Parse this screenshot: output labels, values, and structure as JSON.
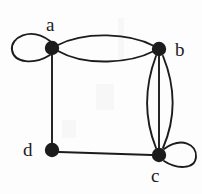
{
  "figure": {
    "type": "undirected-multigraph-diagram",
    "background_color": "#fdfdfd",
    "stroke_color": "#1c1c1c",
    "width": 202,
    "height": 194
  },
  "graph": {
    "vertices": [
      {
        "id": "a",
        "label": "a",
        "cx": 52,
        "cy": 48,
        "r": 7,
        "label_position": "above"
      },
      {
        "id": "b",
        "label": "b",
        "cx": 159,
        "cy": 49,
        "r": 7,
        "label_position": "right"
      },
      {
        "id": "c",
        "label": "c",
        "cx": 159,
        "cy": 155,
        "r": 7,
        "label_position": "below"
      },
      {
        "id": "d",
        "label": "d",
        "cx": 52,
        "cy": 150,
        "r": 7,
        "label_position": "left"
      }
    ],
    "edges": [
      {
        "from": "a",
        "to": "a",
        "kind": "self-loop",
        "direction": "left",
        "multiplicity_index": 1
      },
      {
        "from": "a",
        "to": "b",
        "kind": "curve",
        "bow": "up",
        "multiplicity_index": 1
      },
      {
        "from": "a",
        "to": "b",
        "kind": "curve",
        "bow": "down",
        "multiplicity_index": 2
      },
      {
        "from": "b",
        "to": "c",
        "kind": "curve",
        "bow": "left",
        "multiplicity_index": 1
      },
      {
        "from": "b",
        "to": "c",
        "kind": "line",
        "bow": "none",
        "multiplicity_index": 2
      },
      {
        "from": "b",
        "to": "c",
        "kind": "curve",
        "bow": "right",
        "multiplicity_index": 3
      },
      {
        "from": "c",
        "to": "c",
        "kind": "self-loop",
        "direction": "right",
        "multiplicity_index": 1
      },
      {
        "from": "a",
        "to": "d",
        "kind": "line",
        "bow": "none",
        "multiplicity_index": 1
      },
      {
        "from": "d",
        "to": "c",
        "kind": "line",
        "bow": "none",
        "multiplicity_index": 1
      }
    ],
    "degree_summary": {
      "a": 5,
      "b": 5,
      "c": 6,
      "d": 2
    }
  },
  "labels": {
    "a": "a",
    "b": "b",
    "c": "c",
    "d": "d"
  }
}
